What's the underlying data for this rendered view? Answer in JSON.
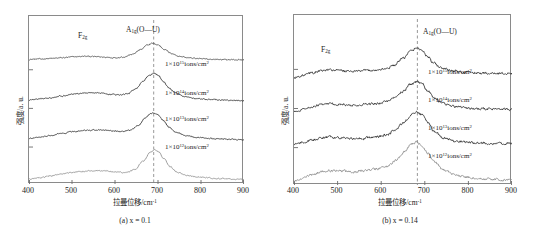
{
  "figure": {
    "panels": [
      {
        "id": "a",
        "subcaption": "(a) x = 0.1",
        "xlabel": "拉曼位移/cm",
        "xlabel_sup": "-1",
        "ylabel": "强度/a. u.",
        "peak_annotation_main": "A",
        "peak_annotation_sub": "1g",
        "peak_annotation_tail": "(O—U)",
        "peak_annotation_secondary": "F",
        "peak_annotation_secondary_sub": "2g",
        "curve_labels": [
          "1×10",
          "1×10",
          "1×10",
          "1×10"
        ],
        "curve_exponents": [
          "15",
          "14",
          "13",
          "12"
        ],
        "curve_units": "ions/cm",
        "curve_units_sup": "2",
        "xticks": [
          "400",
          "500",
          "600",
          "700",
          "800",
          "900"
        ],
        "dashed_line_value": 690
      },
      {
        "id": "b",
        "subcaption": "(b) x = 0.14",
        "xlabel": "拉曼位移/cm",
        "xlabel_sup": "-1",
        "ylabel": "强度/a. u.",
        "peak_annotation_main": "A",
        "peak_annotation_sub": "1g",
        "peak_annotation_tail": "(O—U)",
        "peak_annotation_secondary": "F",
        "peak_annotation_secondary_sub": "2g",
        "curve_labels": [
          "1×10",
          "1×10",
          "1×10",
          "1×10"
        ],
        "curve_exponents": [
          "15",
          "14",
          "13",
          "12"
        ],
        "curve_units": "ions/cm",
        "curve_units_sup": "2",
        "xticks": [
          "400",
          "500",
          "600",
          "700",
          "800",
          "900"
        ],
        "dashed_line_value": 683
      }
    ]
  },
  "chart_data": [
    {
      "type": "line",
      "title": "(a) x = 0.1",
      "xlabel": "拉曼位移/cm-1 (Raman shift/cm-1)",
      "ylabel": "强度/a. u. (Intensity/a.u.)",
      "xlim": [
        400,
        900
      ],
      "ylim": [
        0,
        1
      ],
      "grid": false,
      "legend": "inline-right-of-each-curve",
      "annotations": [
        {
          "text": "F2g",
          "x": 530,
          "note": "broad secondary band"
        },
        {
          "text": "A1g(O—U)",
          "x": 690,
          "note": "main peak, dashed guide line"
        }
      ],
      "dashed_vertical_line_x": 690,
      "series": [
        {
          "name": "1×10^15 ions/cm2",
          "color": "#4a4a4a",
          "baseline_offset": 0.74,
          "peak_x": 686,
          "peak_amplitude": 0.1,
          "peak_width": 52,
          "secondary_peak_x": 530,
          "secondary_amplitude": 0.022,
          "secondary_width": 70,
          "x": [
            400,
            425,
            450,
            475,
            500,
            520,
            530,
            545,
            560,
            580,
            600,
            620,
            640,
            660,
            675,
            686,
            700,
            715,
            730,
            750,
            775,
            800,
            830,
            860,
            900
          ],
          "y": [
            0.742,
            0.744,
            0.747,
            0.751,
            0.756,
            0.759,
            0.76,
            0.759,
            0.757,
            0.754,
            0.752,
            0.756,
            0.772,
            0.8,
            0.826,
            0.838,
            0.828,
            0.802,
            0.778,
            0.76,
            0.75,
            0.745,
            0.742,
            0.74,
            0.739
          ]
        },
        {
          "name": "1×10^14 ions/cm2",
          "color": "#2b2b2b",
          "baseline_offset": 0.5,
          "peak_x": 688,
          "peak_amplitude": 0.155,
          "peak_width": 46,
          "secondary_peak_x": 545,
          "secondary_amplitude": 0.035,
          "secondary_width": 70,
          "x": [
            400,
            425,
            450,
            475,
            500,
            520,
            540,
            555,
            570,
            590,
            610,
            630,
            650,
            665,
            680,
            690,
            700,
            712,
            725,
            740,
            760,
            790,
            820,
            860,
            900
          ],
          "y": [
            0.5,
            0.506,
            0.514,
            0.524,
            0.535,
            0.54,
            0.543,
            0.543,
            0.54,
            0.534,
            0.53,
            0.538,
            0.57,
            0.612,
            0.648,
            0.66,
            0.648,
            0.612,
            0.572,
            0.542,
            0.522,
            0.508,
            0.502,
            0.498,
            0.496
          ]
        },
        {
          "name": "1×10^13 ions/cm2",
          "color": "#2b2b2b",
          "baseline_offset": 0.27,
          "peak_x": 688,
          "peak_amplitude": 0.145,
          "peak_width": 44,
          "secondary_peak_x": 555,
          "secondary_amplitude": 0.045,
          "secondary_width": 75,
          "x": [
            400,
            425,
            450,
            475,
            500,
            520,
            540,
            558,
            575,
            595,
            615,
            635,
            655,
            670,
            682,
            690,
            700,
            712,
            726,
            742,
            765,
            795,
            830,
            865,
            900
          ],
          "y": [
            0.27,
            0.278,
            0.288,
            0.3,
            0.311,
            0.316,
            0.32,
            0.322,
            0.32,
            0.315,
            0.312,
            0.32,
            0.35,
            0.392,
            0.418,
            0.424,
            0.412,
            0.378,
            0.338,
            0.308,
            0.288,
            0.276,
            0.27,
            0.266,
            0.264
          ]
        },
        {
          "name": "1×10^12 ions/cm2",
          "color": "#8c8c8c",
          "baseline_offset": 0.03,
          "peak_x": 692,
          "peak_amplitude": 0.175,
          "peak_width": 38,
          "secondary_peak_x": 555,
          "secondary_amplitude": 0.04,
          "secondary_width": 78,
          "x": [
            400,
            425,
            450,
            475,
            500,
            520,
            540,
            558,
            575,
            595,
            610,
            625,
            645,
            665,
            682,
            692,
            702,
            714,
            728,
            745,
            768,
            800,
            835,
            870,
            900
          ],
          "y": [
            0.03,
            0.038,
            0.048,
            0.06,
            0.07,
            0.074,
            0.078,
            0.08,
            0.078,
            0.073,
            0.07,
            0.068,
            0.084,
            0.134,
            0.188,
            0.205,
            0.19,
            0.15,
            0.104,
            0.07,
            0.05,
            0.04,
            0.034,
            0.03,
            0.028
          ]
        }
      ]
    },
    {
      "type": "line",
      "title": "(b) x = 0.14",
      "xlabel": "拉曼位移/cm-1 (Raman shift/cm-1)",
      "ylabel": "强度/a. u. (Intensity/a.u.)",
      "xlim": [
        400,
        900
      ],
      "ylim": [
        0,
        1
      ],
      "grid": false,
      "legend": "inline-right-of-each-curve",
      "annotations": [
        {
          "text": "F2g",
          "x": 487,
          "note": "broad secondary band"
        },
        {
          "text": "A1g(O—U)",
          "x": 683,
          "note": "main peak, dashed guide line"
        }
      ],
      "dashed_vertical_line_x": 683,
      "series": [
        {
          "name": "1×10^15 ions/cm2",
          "color": "#2b2b2b",
          "baseline_offset": 0.63,
          "peak_x": 682,
          "peak_amplitude": 0.175,
          "peak_width": 42,
          "secondary_peak_x": 487,
          "secondary_amplitude": 0.03,
          "secondary_width": 55,
          "x": [
            400,
            420,
            440,
            460,
            480,
            495,
            510,
            530,
            550,
            570,
            590,
            610,
            630,
            650,
            668,
            682,
            694,
            706,
            720,
            740,
            765,
            795,
            830,
            865,
            900
          ],
          "y": [
            0.63,
            0.644,
            0.658,
            0.67,
            0.676,
            0.676,
            0.672,
            0.668,
            0.67,
            0.674,
            0.676,
            0.684,
            0.704,
            0.744,
            0.788,
            0.806,
            0.792,
            0.756,
            0.716,
            0.686,
            0.67,
            0.662,
            0.658,
            0.656,
            0.655
          ]
        },
        {
          "name": "1×10^14 ions/cm2",
          "color": "#2b2b2b",
          "baseline_offset": 0.43,
          "peak_x": 682,
          "peak_amplitude": 0.165,
          "peak_width": 42,
          "secondary_peak_x": 487,
          "secondary_amplitude": 0.032,
          "secondary_width": 58,
          "x": [
            400,
            420,
            440,
            460,
            480,
            495,
            510,
            530,
            550,
            570,
            590,
            610,
            630,
            650,
            668,
            682,
            694,
            708,
            722,
            742,
            768,
            800,
            835,
            868,
            900
          ],
          "y": [
            0.43,
            0.444,
            0.458,
            0.47,
            0.476,
            0.476,
            0.472,
            0.468,
            0.47,
            0.474,
            0.478,
            0.488,
            0.51,
            0.55,
            0.592,
            0.608,
            0.592,
            0.552,
            0.51,
            0.478,
            0.462,
            0.452,
            0.448,
            0.446,
            0.445
          ]
        },
        {
          "name": "1×10^13 ions/cm2",
          "color": "#2b2b2b",
          "baseline_offset": 0.24,
          "peak_x": 682,
          "peak_amplitude": 0.185,
          "peak_width": 40,
          "secondary_peak_x": 490,
          "secondary_amplitude": 0.028,
          "secondary_width": 60,
          "x": [
            400,
            420,
            440,
            460,
            480,
            496,
            512,
            532,
            552,
            572,
            592,
            612,
            632,
            652,
            668,
            682,
            694,
            708,
            722,
            744,
            770,
            802,
            836,
            870,
            900
          ],
          "y": [
            0.24,
            0.252,
            0.264,
            0.274,
            0.28,
            0.28,
            0.276,
            0.272,
            0.274,
            0.278,
            0.284,
            0.296,
            0.322,
            0.368,
            0.412,
            0.43,
            0.412,
            0.364,
            0.314,
            0.276,
            0.258,
            0.25,
            0.246,
            0.244,
            0.243
          ]
        },
        {
          "name": "1×10^12 ions/cm2",
          "color": "#8c8c8c",
          "baseline_offset": 0.02,
          "peak_x": 680,
          "peak_amplitude": 0.215,
          "peak_width": 40,
          "secondary_peak_x": 492,
          "secondary_amplitude": 0.042,
          "secondary_width": 62,
          "x": [
            400,
            420,
            440,
            462,
            482,
            498,
            514,
            534,
            554,
            574,
            594,
            614,
            634,
            654,
            668,
            680,
            692,
            706,
            720,
            742,
            768,
            800,
            836,
            870,
            900
          ],
          "y": [
            0.02,
            0.04,
            0.06,
            0.078,
            0.086,
            0.086,
            0.082,
            0.078,
            0.082,
            0.088,
            0.096,
            0.112,
            0.146,
            0.198,
            0.238,
            0.252,
            0.238,
            0.192,
            0.138,
            0.09,
            0.06,
            0.044,
            0.036,
            0.032,
            0.03
          ]
        }
      ]
    }
  ]
}
